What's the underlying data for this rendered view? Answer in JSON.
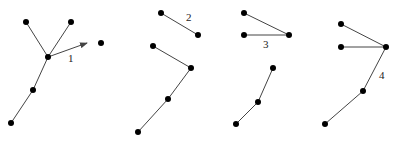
{
  "diagram": {
    "title": "",
    "colors": {
      "edge": "#444444",
      "node": "#000000",
      "label": "#222222",
      "background": "#ffffff"
    },
    "node_radius": 3,
    "panels": [
      {
        "id": "panel-1",
        "label": "1",
        "label_pos": [
          68,
          62
        ],
        "nodes": [
          {
            "id": "a",
            "x": 26,
            "y": 22
          },
          {
            "id": "b",
            "x": 71,
            "y": 22
          },
          {
            "id": "c",
            "x": 48,
            "y": 57
          },
          {
            "id": "d",
            "x": 33,
            "y": 90
          },
          {
            "id": "e",
            "x": 11,
            "y": 123
          },
          {
            "id": "f",
            "x": 101,
            "y": 43
          }
        ],
        "edges": [
          [
            "a",
            "c"
          ],
          [
            "b",
            "c"
          ],
          [
            "c",
            "d"
          ],
          [
            "d",
            "e"
          ]
        ],
        "arrows": [
          {
            "from": [
              48,
              57
            ],
            "to": [
              87,
              43
            ]
          }
        ]
      },
      {
        "id": "panel-2",
        "label": "2",
        "label_pos": [
          186,
          21
        ],
        "nodes": [
          {
            "id": "a",
            "x": 161,
            "y": 13
          },
          {
            "id": "b",
            "x": 198,
            "y": 35
          },
          {
            "id": "c",
            "x": 153,
            "y": 46
          },
          {
            "id": "d",
            "x": 191,
            "y": 68
          },
          {
            "id": "e",
            "x": 168,
            "y": 99
          },
          {
            "id": "f",
            "x": 138,
            "y": 132
          }
        ],
        "edges": [
          [
            "a",
            "b"
          ],
          [
            "c",
            "d"
          ],
          [
            "d",
            "e"
          ],
          [
            "e",
            "f"
          ]
        ],
        "arrows": []
      },
      {
        "id": "panel-3",
        "label": "3",
        "label_pos": [
          263,
          48
        ],
        "nodes": [
          {
            "id": "a",
            "x": 244,
            "y": 13
          },
          {
            "id": "b",
            "x": 244,
            "y": 35
          },
          {
            "id": "c",
            "x": 289,
            "y": 35
          },
          {
            "id": "d",
            "x": 273,
            "y": 68
          },
          {
            "id": "e",
            "x": 258,
            "y": 102
          },
          {
            "id": "f",
            "x": 236,
            "y": 124
          }
        ],
        "edges": [
          [
            "a",
            "c"
          ],
          [
            "b",
            "c"
          ],
          [
            "d",
            "e"
          ],
          [
            "e",
            "f"
          ]
        ],
        "arrows": []
      },
      {
        "id": "panel-4",
        "label": "4",
        "label_pos": [
          379,
          79
        ],
        "nodes": [
          {
            "id": "a",
            "x": 341,
            "y": 24
          },
          {
            "id": "b",
            "x": 341,
            "y": 47
          },
          {
            "id": "c",
            "x": 386,
            "y": 47
          },
          {
            "id": "d",
            "x": 363,
            "y": 91
          },
          {
            "id": "e",
            "x": 325,
            "y": 124
          }
        ],
        "edges": [
          [
            "a",
            "c"
          ],
          [
            "b",
            "c"
          ],
          [
            "c",
            "d"
          ],
          [
            "d",
            "e"
          ]
        ],
        "arrows": []
      }
    ]
  }
}
